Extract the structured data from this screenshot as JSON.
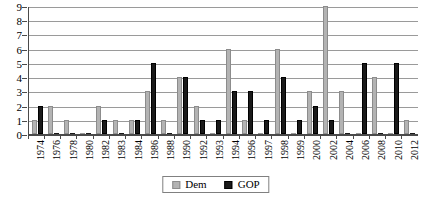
{
  "chart_data": {
    "type": "bar",
    "title": "",
    "subtitle": "",
    "xlabel": "",
    "ylabel": "",
    "ylim": [
      0,
      9
    ],
    "yticks": [
      0,
      1,
      2,
      3,
      4,
      5,
      6,
      7,
      8,
      9
    ],
    "grid": true,
    "legend_position": "bottom-center",
    "orientation": "vertical",
    "grouping": "grouped",
    "categories": [
      "1974",
      "1976",
      "1978",
      "1980",
      "1982",
      "1983",
      "1984",
      "1986",
      "1988",
      "1990",
      "1992",
      "1993",
      "1994",
      "1996",
      "1997",
      "1998",
      "1999",
      "2000",
      "2002",
      "2004",
      "2006",
      "2008",
      "2010",
      "2012"
    ],
    "series": [
      {
        "name": "Dem",
        "color": "#b3b3b3",
        "values": [
          1,
          2,
          1,
          0,
          2,
          1,
          1,
          3,
          1,
          4,
          2,
          0,
          6,
          1,
          0,
          6,
          0,
          3,
          9,
          3,
          0,
          4,
          0,
          1
        ]
      },
      {
        "name": "GOP",
        "color": "#1a1a1a",
        "values": [
          2,
          0,
          0,
          0,
          1,
          0,
          1,
          5,
          0,
          4,
          1,
          1,
          3,
          3,
          1,
          4,
          1,
          2,
          1,
          0,
          5,
          0,
          5,
          0
        ]
      }
    ]
  },
  "legend": {
    "items": [
      {
        "label": "Dem",
        "swatch": "dem"
      },
      {
        "label": "GOP",
        "swatch": "gop"
      }
    ]
  }
}
